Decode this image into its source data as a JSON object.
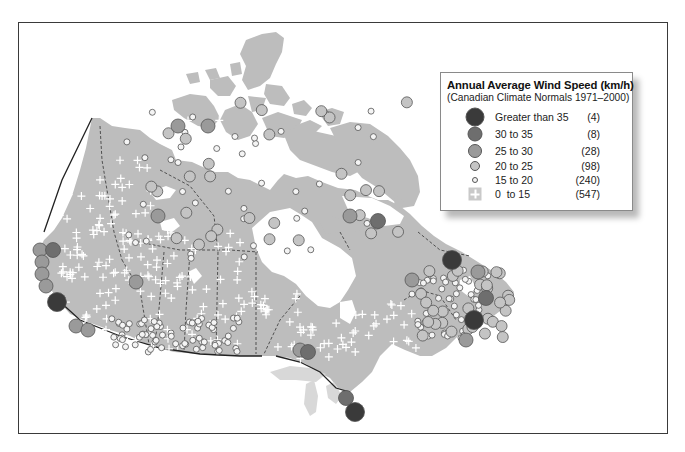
{
  "legend": {
    "title": "Annual Average Wind Speed (km/h)",
    "subtitle": "(Canadian Climate Normals 1971–2000)",
    "classes": [
      {
        "label": "Greater than 35",
        "count": "(4)",
        "color": "#3a3a3a",
        "size": 19,
        "symbol": "circle"
      },
      {
        "label": "30 to 35",
        "count": "(8)",
        "color": "#6e6e6e",
        "size": 15,
        "symbol": "circle"
      },
      {
        "label": "25 to 30",
        "count": "(28)",
        "color": "#9a9a9a",
        "size": 14,
        "symbol": "circle"
      },
      {
        "label": "20 to 25",
        "count": "(98)",
        "color": "#c4c4c4",
        "size": 10,
        "symbol": "circle"
      },
      {
        "label": "15 to 20",
        "count": "(240)",
        "color": "#f4f4f4",
        "size": 6,
        "symbol": "circle"
      },
      {
        "label": "0  to 15",
        "count": "(547)",
        "color": "#c9c9c9",
        "size": 12,
        "symbol": "plus"
      }
    ]
  },
  "map": {
    "land_color": "#bdbdbd",
    "water_color": "#ffffff",
    "lakes_us_color": "#d8d8d8",
    "border_color": "#222222",
    "province_line_color": "#444444"
  },
  "chart_data": {
    "type": "scatter",
    "title": "Annual Average Wind Speed (km/h)",
    "subtitle": "(Canadian Climate Normals 1971–2000)",
    "categories": [
      "Greater than 35",
      "30 to 35",
      "25 to 30",
      "20 to 25",
      "15 to 20",
      "0 to 15"
    ],
    "values": [
      4,
      8,
      28,
      98,
      240,
      547
    ],
    "legend_position": "upper right",
    "region": "Canada"
  }
}
